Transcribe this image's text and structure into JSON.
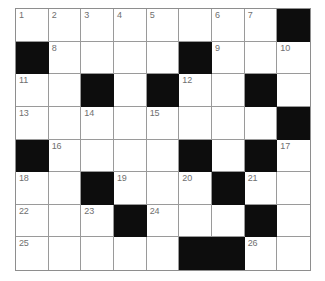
{
  "puzzle": {
    "type": "crossword-grid",
    "columns": 9,
    "rows": 8,
    "colors": {
      "page_background": "#ffffff",
      "cell_fill": "#ffffff",
      "block_fill": "#0d0d0d",
      "grid_line": "#9a9a9a",
      "number_text": "#6f6f6f"
    },
    "cells": [
      [
        {
          "block": false,
          "number": "1"
        },
        {
          "block": false,
          "number": "2"
        },
        {
          "block": false,
          "number": "3"
        },
        {
          "block": false,
          "number": "4"
        },
        {
          "block": false,
          "number": "5"
        },
        {
          "block": false,
          "number": ""
        },
        {
          "block": false,
          "number": "6"
        },
        {
          "block": false,
          "number": "7"
        },
        {
          "block": true,
          "number": ""
        }
      ],
      [
        {
          "block": true,
          "number": ""
        },
        {
          "block": false,
          "number": "8"
        },
        {
          "block": false,
          "number": ""
        },
        {
          "block": false,
          "number": ""
        },
        {
          "block": false,
          "number": ""
        },
        {
          "block": true,
          "number": ""
        },
        {
          "block": false,
          "number": "9"
        },
        {
          "block": false,
          "number": ""
        },
        {
          "block": false,
          "number": "10"
        }
      ],
      [
        {
          "block": false,
          "number": "11"
        },
        {
          "block": false,
          "number": ""
        },
        {
          "block": true,
          "number": ""
        },
        {
          "block": false,
          "number": ""
        },
        {
          "block": true,
          "number": ""
        },
        {
          "block": false,
          "number": "12"
        },
        {
          "block": false,
          "number": ""
        },
        {
          "block": true,
          "number": ""
        },
        {
          "block": false,
          "number": ""
        }
      ],
      [
        {
          "block": false,
          "number": "13"
        },
        {
          "block": false,
          "number": ""
        },
        {
          "block": false,
          "number": "14"
        },
        {
          "block": false,
          "number": ""
        },
        {
          "block": false,
          "number": "15"
        },
        {
          "block": false,
          "number": ""
        },
        {
          "block": false,
          "number": ""
        },
        {
          "block": false,
          "number": ""
        },
        {
          "block": true,
          "number": ""
        }
      ],
      [
        {
          "block": true,
          "number": ""
        },
        {
          "block": false,
          "number": "16"
        },
        {
          "block": false,
          "number": ""
        },
        {
          "block": false,
          "number": ""
        },
        {
          "block": false,
          "number": ""
        },
        {
          "block": true,
          "number": ""
        },
        {
          "block": false,
          "number": ""
        },
        {
          "block": true,
          "number": ""
        },
        {
          "block": false,
          "number": "17"
        }
      ],
      [
        {
          "block": false,
          "number": "18"
        },
        {
          "block": false,
          "number": ""
        },
        {
          "block": true,
          "number": ""
        },
        {
          "block": false,
          "number": "19"
        },
        {
          "block": false,
          "number": ""
        },
        {
          "block": false,
          "number": "20"
        },
        {
          "block": true,
          "number": ""
        },
        {
          "block": false,
          "number": "21"
        },
        {
          "block": false,
          "number": ""
        }
      ],
      [
        {
          "block": false,
          "number": "22"
        },
        {
          "block": false,
          "number": ""
        },
        {
          "block": false,
          "number": "23"
        },
        {
          "block": true,
          "number": ""
        },
        {
          "block": false,
          "number": "24"
        },
        {
          "block": false,
          "number": ""
        },
        {
          "block": false,
          "number": ""
        },
        {
          "block": true,
          "number": ""
        },
        {
          "block": false,
          "number": ""
        }
      ],
      [
        {
          "block": false,
          "number": "25"
        },
        {
          "block": false,
          "number": ""
        },
        {
          "block": false,
          "number": ""
        },
        {
          "block": false,
          "number": ""
        },
        {
          "block": false,
          "number": ""
        },
        {
          "block": true,
          "number": ""
        },
        {
          "block": true,
          "number": ""
        },
        {
          "block": false,
          "number": "26"
        },
        {
          "block": false,
          "number": ""
        }
      ]
    ]
  }
}
